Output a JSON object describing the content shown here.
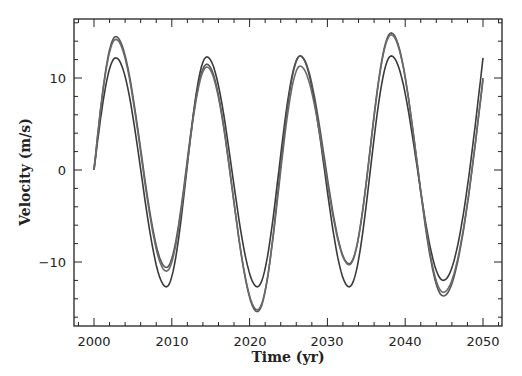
{
  "chart_data": {
    "type": "line",
    "title": "",
    "xlabel": "Time (yr)",
    "ylabel": "Velocity (m/s)",
    "xlim": [
      1998,
      2053
    ],
    "ylim": [
      -16.5,
      16.5
    ],
    "xticks": [
      2000,
      2010,
      2020,
      2030,
      2040,
      2050
    ],
    "yticks": [
      -10,
      0,
      10
    ],
    "grid": false,
    "legend": null,
    "series": [
      {
        "name": "curve-1",
        "color": "#3a3a3a",
        "x": [
          2000,
          2002.8,
          2009.3,
          2014.5,
          2021.0,
          2026.5,
          2032.8,
          2038.2,
          2044.9,
          2050
        ],
        "y": [
          0,
          12.2,
          -12.7,
          12.3,
          -12.7,
          12.4,
          -12.7,
          12.4,
          -12.0,
          12.2
        ]
      },
      {
        "name": "curve-2",
        "color": "#555555",
        "x": [
          2000,
          2002.8,
          2009.3,
          2014.5,
          2021.0,
          2026.5,
          2032.8,
          2038.2,
          2044.9,
          2050
        ],
        "y": [
          0,
          14.5,
          -10.6,
          11.5,
          -15.4,
          12.4,
          -10.2,
          14.9,
          -13.7,
          10.0
        ]
      },
      {
        "name": "curve-3",
        "color": "#6a6a6a",
        "x": [
          2000,
          2002.8,
          2009.3,
          2014.5,
          2021.0,
          2026.5,
          2032.8,
          2038.2,
          2044.9,
          2050
        ],
        "y": [
          0,
          14.2,
          -11.0,
          11.2,
          -15.2,
          11.3,
          -10.3,
          14.7,
          -13.3,
          9.8
        ]
      }
    ]
  },
  "axes": {
    "xlabel": "Time (yr)",
    "ylabel": "Velocity (m/s)",
    "xtick_labels": [
      "2000",
      "2010",
      "2020",
      "2030",
      "2040",
      "2050"
    ],
    "ytick_labels": [
      "−10",
      "0",
      "10"
    ]
  }
}
